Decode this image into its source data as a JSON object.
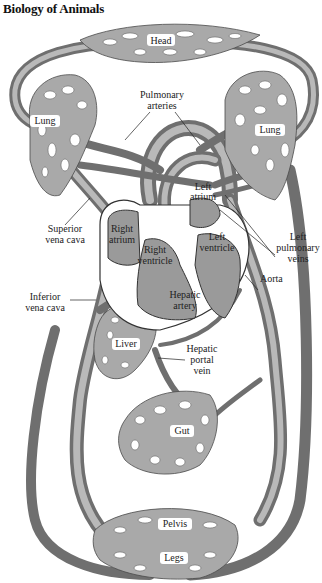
{
  "header": {
    "title": "Biology of Animals"
  },
  "diagram": {
    "colors": {
      "vessel": "#6f6f6f",
      "vessel_highlight": "#b9b9b9",
      "capillary_bed": "#a9a9a9",
      "heart": "#9a9a9a",
      "label": "#222222"
    },
    "labels": {
      "head": "Head",
      "pulmonary_arteries_1": "Pulmonary",
      "pulmonary_arteries_2": "arteries",
      "lung_left_side": "Lung",
      "lung_right_side": "Lung",
      "left_atrium_1": "Left",
      "left_atrium_2": "atrium",
      "left_ventricle_1": "Left",
      "left_ventricle_2": "ventricle",
      "right_atrium_1": "Right",
      "right_atrium_2": "atrium",
      "right_ventricle_1": "Right",
      "right_ventricle_2": "ventricle",
      "superior_vena_cava_1": "Superior",
      "superior_vena_cava_2": "vena cava",
      "left_pulmonary_veins_1": "Left",
      "left_pulmonary_veins_2": "pulmonary",
      "left_pulmonary_veins_3": "veins",
      "aorta": "Aorta",
      "inferior_vena_cava_1": "Inferior",
      "inferior_vena_cava_2": "vena cava",
      "hepatic_artery_1": "Hepatic",
      "hepatic_artery_2": "artery",
      "liver": "Liver",
      "hepatic_portal_vein_1": "Hepatic",
      "hepatic_portal_vein_2": "portal",
      "hepatic_portal_vein_3": "vein",
      "gut": "Gut",
      "pelvis": "Pelvis",
      "legs": "Legs"
    }
  }
}
